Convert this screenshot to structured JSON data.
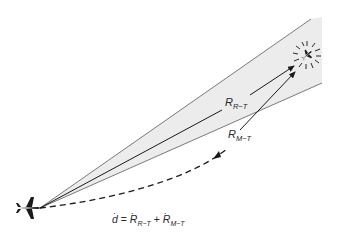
{
  "diagram": {
    "type": "bistatic-geometry",
    "beam": {
      "fill": "#ececec",
      "edge_color": "#7a7a7a"
    },
    "labels": {
      "range_radar_target": {
        "base": "R",
        "sub": "R−T"
      },
      "range_missile_target": {
        "base": "R",
        "sub": "M−T"
      }
    },
    "equation": {
      "lhs": "d",
      "equals": "=",
      "term1_base": "R",
      "term1_sub": "R−T",
      "plus": "+",
      "term2_base": "R",
      "term2_sub": "M−T",
      "dot": "·"
    },
    "icons": {
      "origin": "aircraft-icon",
      "target": "target-aircraft-burst-icon"
    }
  }
}
